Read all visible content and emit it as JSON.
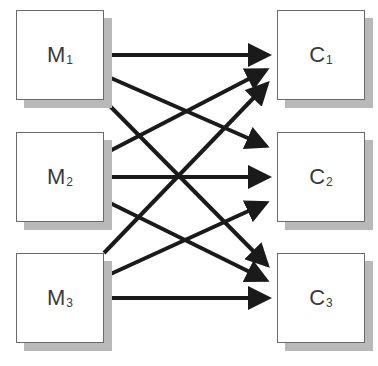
{
  "diagram": {
    "type": "bipartite-flow",
    "left_nodes": [
      {
        "id": "M1",
        "base": "M",
        "sub": "1"
      },
      {
        "id": "M2",
        "base": "M",
        "sub": "2"
      },
      {
        "id": "M3",
        "base": "M",
        "sub": "3"
      }
    ],
    "right_nodes": [
      {
        "id": "C1",
        "base": "C",
        "sub": "1"
      },
      {
        "id": "C2",
        "base": "C",
        "sub": "2"
      },
      {
        "id": "C3",
        "base": "C",
        "sub": "3"
      }
    ],
    "edges": [
      {
        "from": "M1",
        "to": "C1"
      },
      {
        "from": "M1",
        "to": "C2"
      },
      {
        "from": "M1",
        "to": "C3"
      },
      {
        "from": "M2",
        "to": "C1"
      },
      {
        "from": "M2",
        "to": "C2"
      },
      {
        "from": "M2",
        "to": "C3"
      },
      {
        "from": "M3",
        "to": "C1"
      },
      {
        "from": "M3",
        "to": "C2"
      },
      {
        "from": "M3",
        "to": "C3"
      }
    ],
    "colors": {
      "arrow": "#1a1a1a",
      "box_border": "#6a6a6a",
      "box_fill": "#ffffff",
      "shadow": "#b9b9b9",
      "label": "#3a3a3a"
    }
  }
}
